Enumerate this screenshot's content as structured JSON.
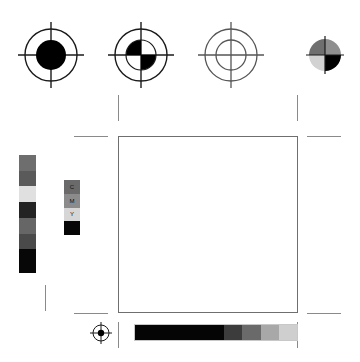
{
  "target": {
    "title": "Print Calibration Test Target",
    "width": 360,
    "height": 362,
    "background": "#ffffff"
  },
  "registration_marks": [
    {
      "name": "registration-mark-solid",
      "label": "solid-core crosshair",
      "x": 18,
      "y": 22,
      "size": 66,
      "outer_radius": 26,
      "inner_radius": 15,
      "style": "solid-dot",
      "fill": "#000000",
      "stroke": "#1a1a1a"
    },
    {
      "name": "registration-mark-quadrant",
      "label": "quadrant crosshair",
      "x": 108,
      "y": 22,
      "size": 66,
      "outer_radius": 26,
      "inner_radius": 15,
      "style": "quadrant",
      "quadrants": [
        "#000000",
        "#ffffff",
        "#ffffff",
        "#000000"
      ],
      "stroke": "#1a1a1a"
    },
    {
      "name": "registration-mark-open",
      "label": "open crosshair",
      "x": 198,
      "y": 22,
      "size": 66,
      "outer_radius": 26,
      "inner_radius": 15,
      "style": "open",
      "fill": "none",
      "stroke": "#555555"
    },
    {
      "name": "registration-mark-gray-quadrant",
      "label": "gray quadrant dot",
      "x": 302,
      "y": 32,
      "size": 46,
      "outer_radius": 16,
      "style": "gray-quadrant",
      "quadrants": [
        "#6f6f6f",
        "#8f8f8f",
        "#d2d2d2",
        "#000000"
      ],
      "stroke": "#1a1a1a"
    },
    {
      "name": "registration-mark-small",
      "label": "small bullseye",
      "x": 90,
      "y": 322,
      "size": 22,
      "outer_radius": 8,
      "inner_radius": 3.2,
      "style": "small-bullseye",
      "fill": "#000000",
      "stroke": "#1a1a1a"
    }
  ],
  "crop_marks": {
    "color": "#8a8a8a",
    "marks": [
      {
        "name": "crop-top-left-vertical",
        "orient": "v",
        "x": 118,
        "y": 95,
        "len": 26
      },
      {
        "name": "crop-top-right-vertical",
        "orient": "v",
        "x": 297,
        "y": 95,
        "len": 26
      },
      {
        "name": "crop-left-upper-horizontal",
        "orient": "h",
        "x": 74,
        "y": 136,
        "len": 34
      },
      {
        "name": "crop-right-upper-horizontal",
        "orient": "h",
        "x": 307,
        "y": 136,
        "len": 34
      },
      {
        "name": "crop-left-lower-horizontal",
        "orient": "h",
        "x": 74,
        "y": 313,
        "len": 34
      },
      {
        "name": "crop-right-lower-horizontal",
        "orient": "h",
        "x": 307,
        "y": 313,
        "len": 34
      },
      {
        "name": "crop-bottom-left-vertical",
        "orient": "v",
        "x": 118,
        "y": 322,
        "len": 26
      },
      {
        "name": "crop-bottom-right-vertical",
        "orient": "v",
        "x": 297,
        "y": 322,
        "len": 26
      },
      {
        "name": "crop-wedge-left-vertical",
        "orient": "v",
        "x": 45,
        "y": 285,
        "len": 26
      }
    ]
  },
  "image_frame": {
    "name": "image-area-frame",
    "x": 118,
    "y": 136,
    "width": 180,
    "height": 177,
    "border_color": "#6f6f6f",
    "fill": "#ffffff"
  },
  "gray_wedge": {
    "name": "gray-step-wedge",
    "x": 19,
    "y": 155,
    "width": 17,
    "height": 118,
    "border": "#ffffff",
    "steps": [
      {
        "name": "wedge-step-1",
        "value": "50%",
        "color": "#6e6e6e"
      },
      {
        "name": "wedge-step-2",
        "value": "60%",
        "color": "#5a5a5a"
      },
      {
        "name": "wedge-step-3",
        "value": "10%",
        "color": "#e0e0e0"
      },
      {
        "name": "wedge-step-4",
        "value": "88%",
        "color": "#232323"
      },
      {
        "name": "wedge-step-5",
        "value": "55%",
        "color": "#666666"
      },
      {
        "name": "wedge-step-6",
        "value": "70%",
        "color": "#4a4a4a"
      },
      {
        "name": "wedge-step-7",
        "value": "100%",
        "color": "#070707"
      }
    ]
  },
  "cmy_patch": {
    "name": "cmy-ink-patch",
    "x": 64,
    "y": 180,
    "width": 16,
    "height": 55,
    "bands": [
      {
        "name": "cmy-band-c",
        "label": "C",
        "color": "#6a6a6a",
        "text_color": "#111111"
      },
      {
        "name": "cmy-band-m",
        "label": "M",
        "color": "#8b8b8b",
        "text_color": "#111111"
      },
      {
        "name": "cmy-band-y",
        "label": "Y",
        "color": "#d6d6d6",
        "text_color": "#111111"
      },
      {
        "name": "cmy-band-k",
        "label": "",
        "color": "#060606",
        "text_color": "#ffffff"
      }
    ]
  },
  "density_strip": {
    "name": "density-step-strip",
    "x": 134,
    "y": 324,
    "width": 164,
    "height": 17,
    "border": "#c8c8c8",
    "patches": [
      {
        "name": "density-patch-1",
        "value": "100%",
        "color": "#050505",
        "flex": 88
      },
      {
        "name": "density-patch-2",
        "value": "75%",
        "color": "#3c3c3c",
        "flex": 18
      },
      {
        "name": "density-patch-3",
        "value": "55%",
        "color": "#6a6a6a",
        "flex": 18
      },
      {
        "name": "density-patch-4",
        "value": "30%",
        "color": "#a8a8a8",
        "flex": 18
      },
      {
        "name": "density-patch-5",
        "value": "15%",
        "color": "#cfcfcf",
        "flex": 18
      }
    ]
  }
}
